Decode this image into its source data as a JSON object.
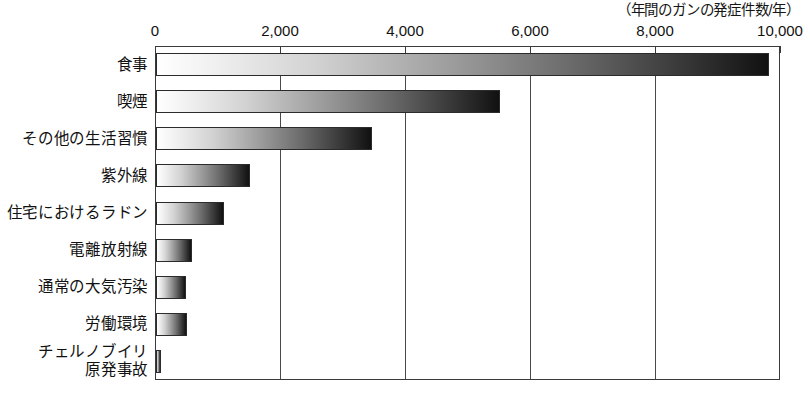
{
  "chart_data": {
    "type": "bar",
    "orientation": "horizontal",
    "title": "",
    "subtitle": "",
    "unit_note": "（年間のガンの発症件数/年）",
    "xlabel": "",
    "ylabel": "",
    "xlim": [
      0,
      10000
    ],
    "grid": true,
    "legend": null,
    "xticks": [
      0,
      2000,
      4000,
      6000,
      8000,
      10000
    ],
    "xtick_labels": [
      "0",
      "2,000",
      "4,000",
      "6,000",
      "8,000",
      "10,000"
    ],
    "categories": [
      "食事",
      "喫煙",
      "その他の生活習慣",
      "紫外線",
      "住宅におけるラドン",
      "電離放射線",
      "通常の大気汚染",
      "労働環境",
      "チェルノブイリ\n原発事故"
    ],
    "values": [
      9800,
      5500,
      3450,
      1500,
      1080,
      580,
      480,
      500,
      60
    ]
  }
}
